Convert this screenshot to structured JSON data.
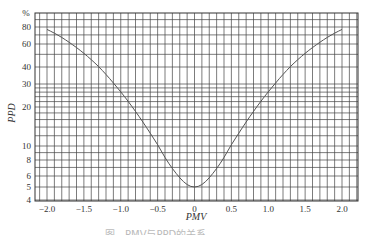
{
  "chart_data": {
    "type": "line",
    "title": "",
    "xlabel": "PMV",
    "ylabel": "PPD",
    "y_unit_label": "%",
    "xlim": [
      -2.16,
      2.2
    ],
    "ylim": [
      4,
      100
    ],
    "y_scale": "probability/log",
    "grid": true,
    "legend": null,
    "x_ticks": [
      "-2.0",
      "-1.5",
      "-1.0",
      "-0.5",
      "0",
      "0.5",
      "1.0",
      "1.5",
      "2.0"
    ],
    "x_tick_values": [
      -2.0,
      -1.5,
      -1.0,
      -0.5,
      0,
      0.5,
      1.0,
      1.5,
      2.0
    ],
    "y_ticks": [
      "80",
      "60",
      "40",
      "30",
      "20",
      "10",
      "8",
      "6",
      "5",
      "4"
    ],
    "y_tick_values": [
      80,
      60,
      40,
      30,
      20,
      10,
      8,
      6,
      5,
      4
    ],
    "series": [
      {
        "name": "PPD",
        "x": [
          -2.0,
          -1.75,
          -1.5,
          -1.25,
          -1.0,
          -0.75,
          -0.5,
          -0.25,
          0,
          0.25,
          0.5,
          0.75,
          1.0,
          1.25,
          1.5,
          1.75,
          2.0
        ],
        "values": [
          76.8,
          64.6,
          51.1,
          37.5,
          26.1,
          16.8,
          10.2,
          6.3,
          5.0,
          6.3,
          10.2,
          16.8,
          26.1,
          37.5,
          51.1,
          64.6,
          76.8
        ]
      }
    ]
  },
  "axes": {
    "y_unit": "%",
    "x_title": "PMV",
    "y_title": "PPD"
  },
  "caption": "图　PMV与PPD的关系"
}
